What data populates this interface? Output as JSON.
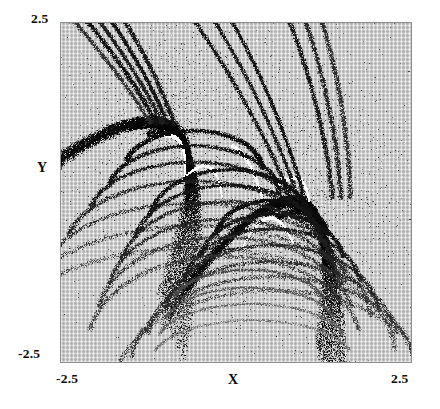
{
  "figure": {
    "type": "fractal-basin-boundary-plot",
    "background_color": "#c7c7c7",
    "frame_color": "#8e8e8e",
    "page_background": "#ffffff"
  },
  "axes": {
    "y_max_label": "2.5",
    "y_min_label": "-2.5",
    "y_axis_title": "Y",
    "x_min_label": "-2.5",
    "x_axis_title": "X",
    "x_max_label": "2.5"
  },
  "chart_data": {
    "type": "scatter",
    "title": "",
    "subtitle": "",
    "xlabel": "X",
    "ylabel": "Y",
    "xlim": [
      -2.5,
      2.5
    ],
    "ylim": [
      -2.5,
      2.5
    ],
    "xticks": [
      -2.5,
      2.5
    ],
    "yticks": [
      -2.5,
      2.5
    ],
    "xticklabels": [
      "-2.5",
      "2.5"
    ],
    "yticklabels": [
      "-2.5",
      "2.5"
    ],
    "grid": false,
    "legend": null,
    "legend_position": "none",
    "annotations": [],
    "features": [
      {
        "name": "upper-left cusp core",
        "x": -0.9,
        "y": 1.0,
        "color": "#101010"
      },
      {
        "name": "lower-right cusp core",
        "x": 0.85,
        "y": -0.05,
        "color": "#101010"
      },
      {
        "name": "upper-left white filament",
        "x": -0.95,
        "y": 0.75,
        "color": "#ffffff"
      },
      {
        "name": "lower-right white filament",
        "x": 0.72,
        "y": 0.05,
        "color": "#ffffff"
      }
    ],
    "series": [
      {
        "name": "basin boundary (black set)",
        "color": "#101010",
        "marker": "point",
        "point_count_estimate": 40000
      },
      {
        "name": "basin interior (white set)",
        "color": "#ffffff",
        "marker": "point",
        "point_count_estimate": 6000
      }
    ]
  }
}
